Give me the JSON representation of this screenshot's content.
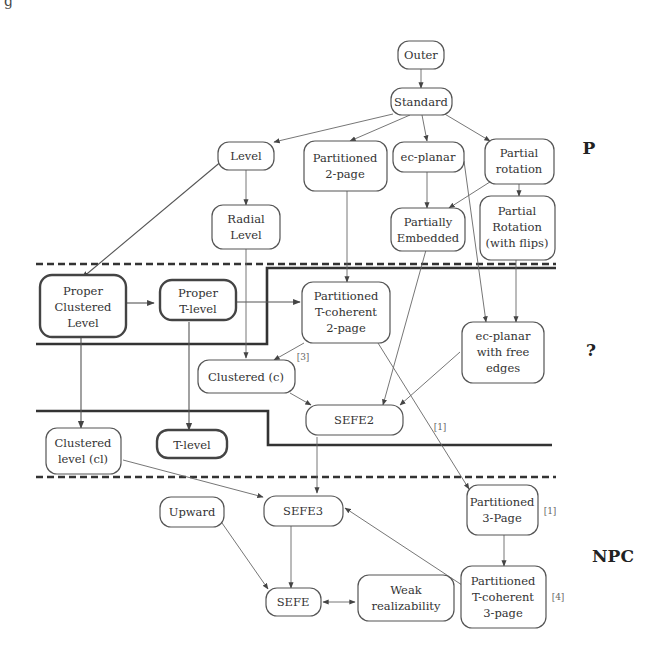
{
  "corner_fragment": "g",
  "classes": {
    "p": "P",
    "unknown": "?",
    "npc": "NPC"
  },
  "nodes": {
    "outer": [
      "Outer"
    ],
    "standard": [
      "Standard"
    ],
    "level": [
      "Level"
    ],
    "partitioned_2page": [
      "Partitioned",
      "2-page"
    ],
    "ec_planar": [
      "ec-planar"
    ],
    "partial_rotation": [
      "Partial",
      "rotation"
    ],
    "radial_level": [
      "Radial",
      "Level"
    ],
    "partially_embedded": [
      "Partially",
      "Embedded"
    ],
    "partial_rotation_flips": [
      "Partial",
      "Rotation",
      "(with flips)"
    ],
    "proper_clustered_level": [
      "Proper",
      "Clustered",
      "Level"
    ],
    "proper_t_level": [
      "Proper",
      "T-level"
    ],
    "partitioned_t_coherent_2page": [
      "Partitioned",
      "T-coherent",
      "2-page"
    ],
    "ec_planar_free_edges": [
      "ec-planar",
      "with free",
      "edges"
    ],
    "clustered_c": [
      "Clustered (c)"
    ],
    "sefe2": [
      "SEFE2"
    ],
    "clustered_level_cl": [
      "Clustered",
      "level (cl)"
    ],
    "t_level": [
      "T-level"
    ],
    "upward": [
      "Upward"
    ],
    "sefe3": [
      "SEFE3"
    ],
    "partitioned_3page": [
      "Partitioned",
      "3-Page"
    ],
    "sefe": [
      "SEFE"
    ],
    "weak_realizability": [
      "Weak",
      "realizability"
    ],
    "partitioned_t_coherent_3page": [
      "Partitioned",
      "T-coherent",
      "3-page"
    ]
  },
  "references": {
    "ref_3": "[3]",
    "ref_1_edge": "[1]",
    "ref_1_node": "[1]",
    "ref_4": "[4]"
  },
  "edges": [
    [
      "outer",
      "standard"
    ],
    [
      "standard",
      "level"
    ],
    [
      "standard",
      "partitioned_2page"
    ],
    [
      "standard",
      "ec_planar"
    ],
    [
      "standard",
      "partial_rotation"
    ],
    [
      "level",
      "radial_level"
    ],
    [
      "level",
      "proper_clustered_level"
    ],
    [
      "ec_planar",
      "partially_embedded"
    ],
    [
      "partial_rotation",
      "partially_embedded"
    ],
    [
      "partial_rotation",
      "partial_rotation_flips"
    ],
    [
      "proper_clustered_level",
      "proper_t_level"
    ],
    [
      "proper_t_level",
      "partitioned_t_coherent_2page"
    ],
    [
      "partitioned_2page",
      "partitioned_t_coherent_2page"
    ],
    [
      "ec_planar",
      "ec_planar_free_edges"
    ],
    [
      "partial_rotation_flips",
      "ec_planar_free_edges"
    ],
    [
      "radial_level",
      "clustered_c"
    ],
    [
      "partitioned_t_coherent_2page",
      "clustered_c"
    ],
    [
      "clustered_c",
      "sefe2"
    ],
    [
      "partially_embedded",
      "sefe2"
    ],
    [
      "ec_planar_free_edges",
      "sefe2"
    ],
    [
      "proper_clustered_level",
      "clustered_level_cl"
    ],
    [
      "proper_t_level",
      "t_level"
    ],
    [
      "partitioned_t_coherent_2page",
      "partitioned_3page"
    ],
    [
      "sefe2",
      "sefe3"
    ],
    [
      "clustered_level_cl",
      "sefe3"
    ],
    [
      "partitioned_t_coherent_3page",
      "sefe3"
    ],
    [
      "partitioned_3page",
      "partitioned_t_coherent_3page"
    ],
    [
      "upward",
      "sefe"
    ],
    [
      "sefe3",
      "sefe"
    ],
    [
      "sefe",
      "weak_realizability"
    ]
  ]
}
